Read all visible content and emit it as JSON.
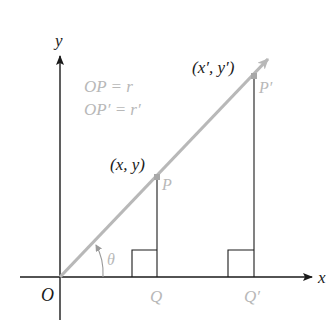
{
  "diagram": {
    "type": "coordinate-rotation-scaling",
    "axes": {
      "x_label": "x",
      "y_label": "y",
      "origin_label": "O"
    },
    "points": {
      "P": {
        "label": "P",
        "coord_label": "(x, y)"
      },
      "P_prime": {
        "label": "P′",
        "coord_label": "(x′, y′)"
      },
      "Q": {
        "label": "Q"
      },
      "Q_prime": {
        "label": "Q′"
      }
    },
    "angle_label": "θ",
    "relations": [
      "OP = r",
      "OP′ = r′"
    ],
    "colors": {
      "axis": "#1a1a1a",
      "ray": "#b8b8b8",
      "highlight_text": "#b8b8b8",
      "text": "#1a1a1a"
    }
  }
}
